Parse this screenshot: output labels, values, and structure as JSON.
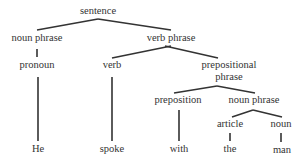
{
  "diagram": {
    "type": "parse-tree",
    "line_color": "#333333",
    "text_color": "#333333",
    "nodes": [
      {
        "id": "sentence",
        "label": "sentence",
        "x": 98,
        "y": 14
      },
      {
        "id": "np1",
        "label": "noun phrase",
        "x": 37,
        "y": 41
      },
      {
        "id": "vp",
        "label": "verb phrase",
        "x": 171,
        "y": 41
      },
      {
        "id": "pronoun",
        "label": "pronoun",
        "x": 37,
        "y": 68
      },
      {
        "id": "verb",
        "label": "verb",
        "x": 112,
        "y": 68
      },
      {
        "id": "pp_line1",
        "label": "prepositional",
        "x": 229,
        "y": 68
      },
      {
        "id": "pp_line2",
        "label": "phrase",
        "x": 229,
        "y": 80
      },
      {
        "id": "prep",
        "label": "preposition",
        "x": 178,
        "y": 103
      },
      {
        "id": "np2",
        "label": "noun phrase",
        "x": 254,
        "y": 103
      },
      {
        "id": "article",
        "label": "article",
        "x": 230,
        "y": 127
      },
      {
        "id": "noun",
        "label": "noun",
        "x": 281,
        "y": 127
      },
      {
        "id": "he",
        "label": "He",
        "x": 38,
        "y": 152
      },
      {
        "id": "spoke",
        "label": "spoke",
        "x": 112,
        "y": 152
      },
      {
        "id": "with",
        "label": "with",
        "x": 179,
        "y": 152
      },
      {
        "id": "the",
        "label": "the",
        "x": 230,
        "y": 152
      },
      {
        "id": "man",
        "label": "man",
        "x": 282,
        "y": 153
      }
    ],
    "edges": [
      {
        "from": "sentence",
        "to": "np1",
        "x1": 98,
        "y1": 19,
        "x2": 37,
        "y2": 30
      },
      {
        "from": "sentence",
        "to": "vp",
        "x1": 98,
        "y1": 19,
        "x2": 171,
        "y2": 30
      },
      {
        "from": "np1",
        "to": "pronoun",
        "x1": 37,
        "y1": 49,
        "x2": 37,
        "y2": 57
      },
      {
        "from": "vp",
        "to": "verb",
        "x1": 171,
        "y1": 46,
        "x2": 112,
        "y2": 58
      },
      {
        "from": "vp",
        "to": "pp",
        "x1": 165,
        "y1": 46,
        "x2": 218,
        "y2": 58
      },
      {
        "from": "pronoun",
        "to": "he",
        "x1": 38,
        "y1": 77,
        "x2": 38,
        "y2": 141
      },
      {
        "from": "verb",
        "to": "spoke",
        "x1": 112,
        "y1": 77,
        "x2": 112,
        "y2": 141
      },
      {
        "from": "pp",
        "to": "prep",
        "x1": 217,
        "y1": 86,
        "x2": 174,
        "y2": 93
      },
      {
        "from": "pp",
        "to": "np2",
        "x1": 217,
        "y1": 86,
        "x2": 255,
        "y2": 93
      },
      {
        "from": "prep",
        "to": "with",
        "x1": 179,
        "y1": 110,
        "x2": 179,
        "y2": 141
      },
      {
        "from": "np2",
        "to": "article",
        "x1": 253,
        "y1": 110,
        "x2": 232,
        "y2": 117
      },
      {
        "from": "np2",
        "to": "noun",
        "x1": 253,
        "y1": 110,
        "x2": 282,
        "y2": 117
      },
      {
        "from": "article",
        "to": "the",
        "x1": 230,
        "y1": 133,
        "x2": 230,
        "y2": 141
      },
      {
        "from": "noun",
        "to": "man",
        "x1": 281,
        "y1": 133,
        "x2": 281,
        "y2": 142
      }
    ]
  }
}
